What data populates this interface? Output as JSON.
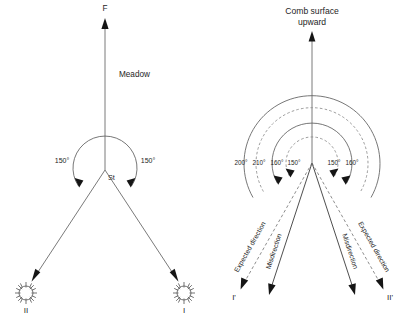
{
  "figure": {
    "panels": [
      {
        "id": "left",
        "name": "meadow-panel",
        "reference_label": "F",
        "area_label": "Meadow",
        "hive_label": "St",
        "angles": [
          {
            "side": "left",
            "text": "150°"
          },
          {
            "side": "right",
            "text": "150°"
          }
        ],
        "targets": [
          {
            "id": "sun-two",
            "label": "II",
            "icon": "sun-icon",
            "side": "left"
          },
          {
            "id": "sun-one",
            "label": "I",
            "icon": "sun-icon",
            "side": "right"
          }
        ]
      },
      {
        "id": "right",
        "name": "comb-panel",
        "title_line1": "Comb surface",
        "title_line2": "upward",
        "angles_left": [
          "200°",
          "210°",
          "160°",
          "150°"
        ],
        "angles_right": [
          "150°",
          "160°"
        ],
        "ray_labels": [
          {
            "side": "left",
            "expected": "Expected direction",
            "actual": "Misdirection"
          },
          {
            "side": "right",
            "expected": "Expected direction",
            "actual": "Misdirection"
          }
        ],
        "targets": [
          {
            "id": "dir-one-prime",
            "label": "I'",
            "side": "left"
          },
          {
            "id": "dir-two-prime",
            "label": "II'",
            "side": "right"
          }
        ]
      }
    ]
  },
  "colors": {
    "background": "#ffffff",
    "line": "#6b6b6b",
    "line_dark": "#444444",
    "arrowhead": "#151515",
    "text": "#1e1e1e",
    "dashed": "#8a8a8a"
  }
}
